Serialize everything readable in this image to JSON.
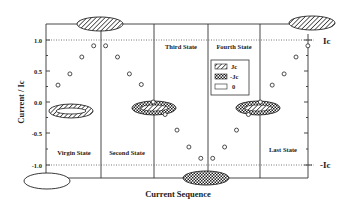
{
  "chart_data": {
    "type": "scatter",
    "title": "",
    "xlabel": "Current Sequence",
    "ylabel": "Current / Ic",
    "ylim": [
      -1.25,
      1.25
    ],
    "y_ticks": [
      "1.0",
      "0.5",
      "0.0",
      "-0.5",
      "-1.0"
    ],
    "y_tick_values": [
      1.0,
      0.5,
      0.0,
      -0.5,
      -1.0
    ],
    "grid": false,
    "reference_lines": [
      {
        "y": 1.0,
        "style": "dotted",
        "label": "Ic"
      },
      {
        "y": -1.0,
        "style": "dotted",
        "label": "-Ic"
      }
    ],
    "states": [
      "Virgin State",
      "Second State",
      "Third State",
      "Fourth State",
      "Last State"
    ],
    "series": [
      {
        "name": "Current / Ic",
        "marker": "open-circle",
        "x": [
          1,
          2,
          3,
          4,
          5,
          6,
          7,
          8,
          9,
          10,
          11,
          12,
          13,
          14,
          15,
          16,
          17,
          18,
          19,
          20,
          21,
          22
        ],
        "values": [
          0.27,
          0.45,
          0.72,
          0.9,
          0.9,
          0.72,
          0.45,
          0.28,
          0.0,
          -0.2,
          -0.45,
          -0.72,
          -0.9,
          -0.9,
          -0.72,
          -0.45,
          -0.2,
          0.0,
          0.27,
          0.45,
          0.72,
          0.9
        ]
      }
    ],
    "legend": {
      "position": "inside-right",
      "entries": [
        {
          "label": "Jc",
          "pattern": "hatched"
        },
        {
          "label": "-Jc",
          "pattern": "checkered"
        },
        {
          "label": "0",
          "pattern": "empty"
        }
      ]
    },
    "annotations": [
      {
        "type": "ellipse",
        "pattern": "hatched",
        "position": "top",
        "at_state_boundary": 1
      },
      {
        "type": "ellipse",
        "pattern": "hatched",
        "position": "top-right",
        "at_state_boundary": 5
      },
      {
        "type": "ellipse",
        "pattern": "empty",
        "position": "bottom-left",
        "at_state_boundary": 0
      },
      {
        "type": "ellipse",
        "pattern": "checkered",
        "position": "bottom",
        "at_state_boundary": 3
      },
      {
        "type": "ellipse",
        "pattern": "hatched-ring",
        "position": "zero-line",
        "state": "Virgin State"
      },
      {
        "type": "ellipse",
        "pattern": "checkered-with-hatched-core",
        "position": "zero-line",
        "at_state_boundary": 2
      },
      {
        "type": "ellipse",
        "pattern": "checkered-with-hatched-core",
        "position": "zero-line",
        "at_state_boundary": 4
      }
    ]
  },
  "labels": {
    "ylabel": "Current / Ic",
    "xlabel": "Current Sequence",
    "ic_pos": "Ic",
    "ic_neg": "-Ic",
    "states": [
      "Virgin State",
      "Second State",
      "Third State",
      "Fourth State",
      "Last State"
    ],
    "ticks": [
      "1.0",
      "0.5",
      "0.0",
      "-0.5",
      "-1.0"
    ],
    "legend": [
      "Jc",
      "-Jc",
      "0"
    ]
  }
}
